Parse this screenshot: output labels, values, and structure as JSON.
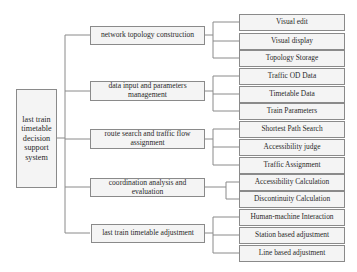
{
  "diagram": {
    "type": "tree",
    "root": {
      "label": "last train timetable decision support system"
    },
    "modules": [
      {
        "label": "network topology construction",
        "children": [
          "Visual edit",
          "Visual display",
          "Topology Storage"
        ]
      },
      {
        "label": "data input and parameters management",
        "children": [
          "Traffic OD Data",
          "Timetable Data",
          "Train Parameters"
        ]
      },
      {
        "label": "route search and traffic flow assignment",
        "children": [
          "Shortest Path Search",
          "Accessibility judge",
          "Traffic Assignment"
        ]
      },
      {
        "label": "coordination analysis and evaluation",
        "children": [
          "Accessibility Calculation",
          "Discontinuity Calculation"
        ]
      },
      {
        "label": "last train timetable adjustment",
        "children": [
          "Human-machine Interaction",
          "Station based adjustment",
          "Line based adjustment"
        ]
      }
    ]
  },
  "colors": {
    "border": "#8a8a8a",
    "box_fill": "#f4f4f4",
    "text": "#2a2a2a",
    "background": "#ffffff"
  }
}
